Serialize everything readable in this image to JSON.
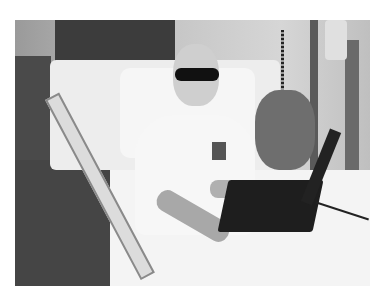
{
  "image": {
    "description": "Grayscale photograph of a bald person wearing dark sunglasses and a white t-shirt, sitting up in a hospital bed with a black laptop computer on their lap",
    "style": "black-and-white photo",
    "colors": {
      "background": "#ffffff",
      "wall": "#b8b8b8",
      "dark_panel": "#3c3c3c",
      "sheets": "#f2f2f2",
      "laptop": "#1e1e1e",
      "floor": "#454545"
    },
    "objects": [
      "hospital-bed",
      "bed-rail",
      "pillow",
      "person",
      "sunglasses",
      "t-shirt",
      "laptop",
      "stuffed-animal",
      "iv-pole",
      "medical-equipment",
      "phone-cord"
    ]
  }
}
